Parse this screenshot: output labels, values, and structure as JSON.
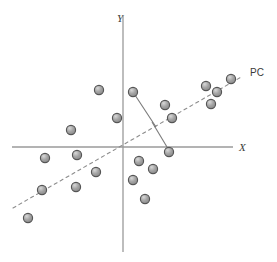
{
  "figure": {
    "title": "",
    "axes": {
      "x_label": "X",
      "y_label": "Y",
      "x_axis_color": "#9a9a9a",
      "y_axis_color": "#9a9a9a",
      "origin": {
        "x": 123,
        "y": 147
      },
      "x_axis_extent": {
        "x1": 12,
        "x2": 233
      },
      "y_axis_extent": {
        "y1": 16,
        "y2": 252
      }
    },
    "pc_line": {
      "label": "PC",
      "label_x": 252,
      "label_y": 76,
      "style": "dashed",
      "color": "#8d8d8d",
      "x1": 13,
      "y1": 208,
      "x2": 243,
      "y2": 76
    },
    "projection_lines": {
      "color": "#7a7a7a",
      "segments": [
        {
          "x1": 133,
          "y1": 92,
          "x2": 156,
          "y2": 127
        },
        {
          "x1": 152,
          "y1": 122,
          "x2": 170,
          "y2": 152
        }
      ]
    },
    "marker_style": {
      "fill": "#9e9e9e",
      "stroke": "#555555",
      "highlight": "#d5d5d5",
      "radius": 4.6
    }
  },
  "chart_data": {
    "type": "scatter",
    "title": "",
    "xlabel": "X",
    "ylabel": "Y",
    "grid": false,
    "legend": null,
    "annotations": [
      {
        "text": "PC",
        "x": 252,
        "y": 76
      },
      {
        "text": "X",
        "x": 242,
        "y": 148
      },
      {
        "text": "Y",
        "x": 120,
        "y": 18
      }
    ],
    "points_px": [
      {
        "x": 99,
        "y": 90
      },
      {
        "x": 133,
        "y": 92
      },
      {
        "x": 117,
        "y": 118
      },
      {
        "x": 71,
        "y": 130
      },
      {
        "x": 165,
        "y": 105
      },
      {
        "x": 172,
        "y": 118
      },
      {
        "x": 206,
        "y": 86
      },
      {
        "x": 217,
        "y": 92
      },
      {
        "x": 211,
        "y": 104
      },
      {
        "x": 231,
        "y": 79
      },
      {
        "x": 45,
        "y": 158
      },
      {
        "x": 77,
        "y": 155
      },
      {
        "x": 96,
        "y": 172
      },
      {
        "x": 42,
        "y": 190
      },
      {
        "x": 76,
        "y": 187
      },
      {
        "x": 28,
        "y": 218
      },
      {
        "x": 139,
        "y": 161
      },
      {
        "x": 153,
        "y": 169
      },
      {
        "x": 133,
        "y": 180
      },
      {
        "x": 169,
        "y": 152
      },
      {
        "x": 145,
        "y": 199
      }
    ],
    "x": [
      -24,
      10,
      -6,
      -52,
      42,
      49,
      83,
      94,
      88,
      108,
      -78,
      -46,
      -27,
      -81,
      -47,
      -95,
      16,
      30,
      10,
      46,
      22
    ],
    "y": [
      57,
      55,
      29,
      17,
      42,
      29,
      61,
      55,
      43,
      68,
      -11,
      -8,
      -25,
      -43,
      -40,
      -71,
      -14,
      -22,
      -33,
      -5,
      -52
    ],
    "xlim": [
      -111,
      110
    ],
    "ylim": [
      -105,
      131
    ]
  }
}
